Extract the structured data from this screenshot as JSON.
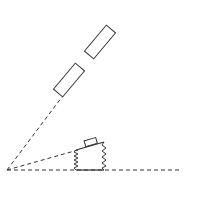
{
  "diagram": {
    "colors": {
      "stroke": "#333333",
      "background": "#ffffff"
    },
    "origin": {
      "x": 7,
      "y": 170
    },
    "rays": [
      {
        "name": "horizontal-ray",
        "x2": 180,
        "y2": 170
      },
      {
        "name": "inclined-ray",
        "x2": 80,
        "y2": 150
      },
      {
        "name": "steep-ray",
        "x2": 62,
        "y2": 97
      }
    ],
    "rectangles": [
      {
        "name": "lower-rectangle",
        "cx": 69,
        "cy": 80,
        "w": 12,
        "h": 34,
        "angle": 40
      },
      {
        "name": "upper-rectangle",
        "cx": 100,
        "cy": 42,
        "w": 12,
        "h": 34,
        "angle": 40
      }
    ],
    "springs": [
      {
        "name": "left-spring",
        "x": 76,
        "y1": 150,
        "y2": 170
      },
      {
        "name": "right-spring",
        "x": 104,
        "y1": 143,
        "y2": 170
      }
    ],
    "block": {
      "x": 86,
      "y": 140,
      "w": 11,
      "h": 6
    }
  }
}
